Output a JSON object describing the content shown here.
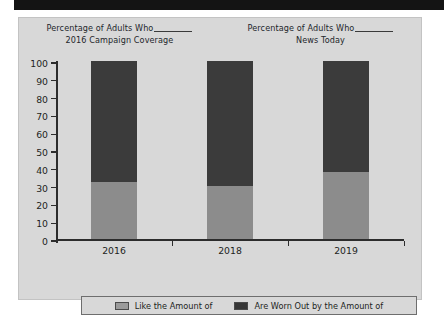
{
  "chart_data": {
    "type": "bar",
    "stacked": true,
    "title": "",
    "titles": [
      {
        "line1": "Percentage of Adults Who",
        "line2": "2016 Campaign Coverage",
        "has_blank": true
      },
      {
        "line1": "Percentage of Adults Who",
        "line2": "News Today",
        "has_blank": true
      }
    ],
    "categories": [
      "2016",
      "2018",
      "2019"
    ],
    "series": [
      {
        "name": "Like the Amount of",
        "values": [
          32,
          30,
          38
        ],
        "color": "#8c8c8c"
      },
      {
        "name": "Are Worn Out by the Amount of",
        "values": [
          68,
          70,
          62
        ],
        "color": "#3b3b3b"
      }
    ],
    "xlabel": "",
    "ylabel": "",
    "ylim": [
      0,
      100
    ],
    "yticks": [
      0,
      10,
      20,
      30,
      40,
      50,
      60,
      70,
      80,
      90,
      100
    ],
    "ytick_labels": [
      "0",
      "10",
      "20",
      "30",
      "40",
      "50",
      "60",
      "70",
      "80",
      "90",
      "100"
    ],
    "grid": false,
    "legend_position": "bottom"
  },
  "legend": {
    "items": [
      {
        "label": "Like the Amount of",
        "swatch": "light-gray-swatch"
      },
      {
        "label": "Are Worn Out by the Amount of",
        "swatch": "dark-gray-swatch"
      }
    ]
  },
  "colors": {
    "panel_background": "#d8d8d8",
    "series_light": "#8c8c8c",
    "series_dark": "#3b3b3b",
    "axis": "#2c2c2c",
    "text": "#1d1f22",
    "top_bar": "#141414"
  }
}
